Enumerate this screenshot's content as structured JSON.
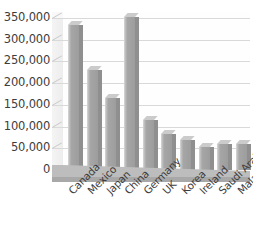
{
  "chart_data": {
    "type": "bar",
    "title": "",
    "xlabel": "",
    "ylabel": "",
    "categories": [
      "Canada",
      "Mexico",
      "Japan",
      "China",
      "Germany",
      "UK",
      "Korea",
      "Ireland",
      "Saudi Arabia",
      "Malaysia"
    ],
    "values": [
      335000,
      231000,
      165000,
      352000,
      116000,
      82000,
      69000,
      52000,
      59000,
      59000
    ],
    "ylim": [
      0,
      350000
    ],
    "ytick_labels": [
      "350,000",
      "300,000",
      "250,000",
      "200,000",
      "150,000",
      "100,000",
      "50,000",
      "0"
    ],
    "ytick_values": [
      350000,
      300000,
      250000,
      200000,
      150000,
      100000,
      50000,
      0
    ],
    "grid": true,
    "legend": "none",
    "style": "3d-column",
    "bar_color": "#a6a6a6",
    "gridline_color": "#d9d9d9",
    "floor_color": "#bdbdbd",
    "text_color": "#3d3d3d",
    "background": "#ffffff"
  }
}
